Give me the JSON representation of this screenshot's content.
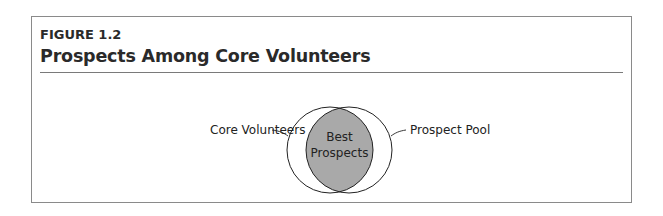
{
  "figure": {
    "label": "FIGURE 1.2",
    "title": "Prospects Among Core Volunteers"
  },
  "diagram": {
    "type": "venn",
    "left_set": "Core Volunteers",
    "right_set": "Prospect Pool",
    "intersection_line1": "Best",
    "intersection_line2": "Prospects",
    "colors": {
      "intersection_fill": "#a9a9a9",
      "stroke": "#222222",
      "frame": "#8a8a8a"
    }
  }
}
